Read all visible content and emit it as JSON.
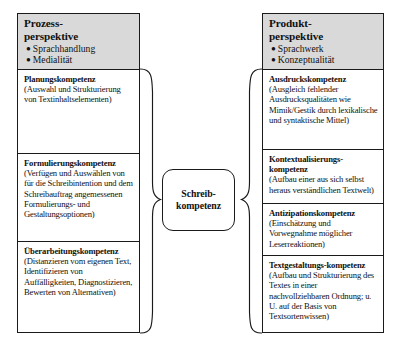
{
  "diagram": {
    "centre": {
      "name": "schreibkompetenz",
      "line1": "Schreib-",
      "line2": "kompetenz"
    },
    "columns": [
      {
        "id": "prozessperspektive",
        "side": "left",
        "header": {
          "title_line1": "Prozess-",
          "title_line2": "perspektive",
          "bullets": [
            "Sprachhandlung",
            "Medialität"
          ]
        },
        "cells": [
          {
            "id": "planungskompetenz",
            "title": "Planungskompetenz",
            "body": "(Auswahl und Strukturierung von Textinhaltselementen)"
          },
          {
            "id": "formulierungskompetenz",
            "title": "Formulierungskompetenz",
            "body": "(Verfügen und Auswählen von für die Schreibintention und dem Schreibauftrag angemessenen Formulierungs- und Gestaltungsoptionen)"
          },
          {
            "id": "ueberarbeitungskompetenz",
            "title": "Überarbeitungskompetenz",
            "body": "(Distanzieren vom eigenen Text, Identifizieren von Auffälligkeiten, Diagnostizieren, Bewerten von Alternativen)"
          }
        ]
      },
      {
        "id": "produktperspektive",
        "side": "right",
        "header": {
          "title_line1": "Produkt-",
          "title_line2": "perspektive",
          "bullets": [
            "Sprachwerk",
            "Konzeptualität"
          ]
        },
        "cells": [
          {
            "id": "ausdruckskompetenz",
            "title": "Ausdruckskompetenz",
            "body": "(Ausgleich fehlender Ausdrucksqualitäten wie Mimik/Gestik durch lexikalische und syntaktische Mittel)"
          },
          {
            "id": "kontextualisierungskompetenz",
            "title": "Kontextualisierungs-kompetenz",
            "body": "(Aufbau einer aus sich selbst heraus verständlichen Textwelt)"
          },
          {
            "id": "antizipationskompetenz",
            "title": "Antizipationskompetenz",
            "body": "(Einschätzung und Vorwegnahme möglicher Leserreaktionen)"
          },
          {
            "id": "textgestaltungskompetenz",
            "title": "Textgestaltungs-kompetenz",
            "body": "(Aufbau und Strukturierung des Textes in einer nachvollziehbaren Ordnung; u. U. auf der Basis von Textsortenwissen)"
          }
        ]
      }
    ],
    "colors": {
      "header_fill": "#d9d9d9",
      "stroke": "#1a1a1a",
      "background": "#ffffff"
    }
  }
}
